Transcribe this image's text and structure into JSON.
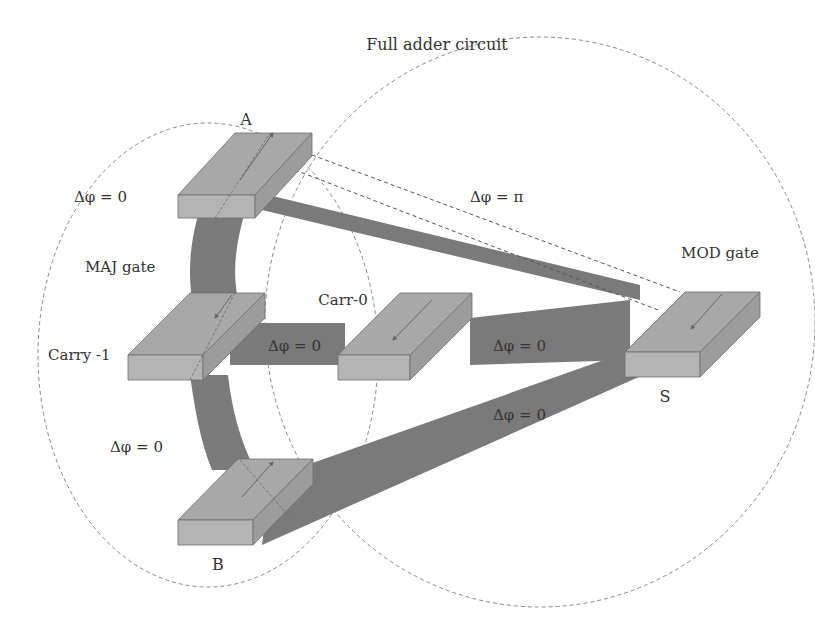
{
  "title": "Full adder circuit",
  "colors": {
    "background": "#ffffff",
    "waveguide": "#7a7a7a",
    "block_top": "#a8a8a8",
    "block_front": "#b4b4b4",
    "block_side": "#9c9c9c",
    "block_edge": "#6e6e6e",
    "dashed": "#555555",
    "text": "#333333"
  },
  "gates": {
    "maj": "MAJ gate",
    "mod": "MOD gate"
  },
  "nodes": {
    "a": "A",
    "b": "B",
    "carry1": "Carry -1",
    "carr0": "Carr-0",
    "s": "S"
  },
  "phases": {
    "a_left": "Δφ = 0",
    "a_to_s": "Δφ = π",
    "maj_b": "Δφ = 0",
    "carry1_carr0": "Δφ = 0",
    "carr0_s": "Δφ = 0",
    "b_s": "Δφ = 0"
  }
}
